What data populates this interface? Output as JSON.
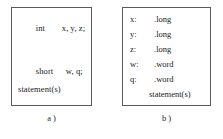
{
  "figure": {
    "panels": [
      {
        "id": "a",
        "caption": "a )",
        "lines": [
          {
            "keyword": "int",
            "rest": "x, y, z;"
          },
          {
            "keyword": "short",
            "rest": "w, q;"
          },
          {
            "keyword": "",
            "rest": "statement(s)"
          }
        ]
      },
      {
        "id": "b",
        "caption": "b )",
        "rows": [
          {
            "label": "x:",
            "value": ".long"
          },
          {
            "label": "y:",
            "value": ".long"
          },
          {
            "label": "z:",
            "value": ".long"
          },
          {
            "label": "w:",
            "value": ".word"
          },
          {
            "label": "q:",
            "value": ".word"
          },
          {
            "label": "",
            "value": "statement(s)"
          }
        ]
      }
    ]
  },
  "colors": {
    "border": "#5a5a5a",
    "text": "#1a1a1a",
    "background": "#ffffff"
  }
}
